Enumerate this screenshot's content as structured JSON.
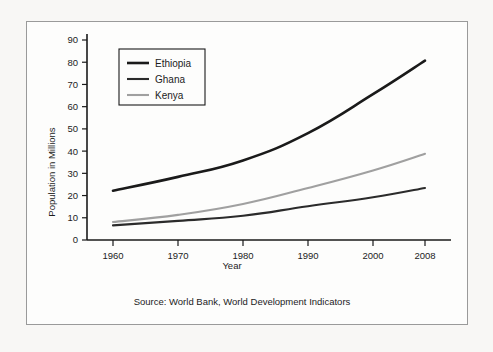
{
  "figure": {
    "source_note": "Source: World Bank, World Development Indicators",
    "frame_color": "#9a9a9a",
    "background_color": "#f8f7f5",
    "panel_color": "#fdfdfc"
  },
  "chart_data": {
    "type": "line",
    "title": "",
    "xlabel": "Year",
    "ylabel": "Population in Millions",
    "x": [
      1960,
      1970,
      1980,
      1990,
      2000,
      2008
    ],
    "categories": [
      "1960",
      "1970",
      "1980",
      "1990",
      "2000",
      "2008"
    ],
    "xlim": [
      1956,
      2012
    ],
    "ylim": [
      0,
      90
    ],
    "xticks": [
      1960,
      1970,
      1980,
      1990,
      2000,
      2008
    ],
    "xticklabels": [
      "1960",
      "1970",
      "1980",
      "1990",
      "2000",
      "2008"
    ],
    "yticks": [
      0,
      10,
      20,
      30,
      40,
      50,
      60,
      70,
      80,
      90
    ],
    "yticklabels": [
      "0",
      "10",
      "20",
      "30",
      "40",
      "50",
      "60",
      "70",
      "80",
      "90"
    ],
    "grid": false,
    "legend_position": "upper left",
    "series": [
      {
        "name": "Ethiopia",
        "values": [
          22.2,
          28.4,
          35.8,
          48.1,
          65.6,
          80.7
        ],
        "color": "#1a1a1a",
        "width": 2.6
      },
      {
        "name": "Ghana",
        "values": [
          6.6,
          8.6,
          10.9,
          15.2,
          19.2,
          23.4
        ],
        "color": "#2b2b2b",
        "width": 2.1
      },
      {
        "name": "Kenya",
        "values": [
          8.1,
          11.3,
          16.2,
          23.4,
          31.3,
          38.8
        ],
        "color": "#a0a0a0",
        "width": 2.1
      }
    ]
  },
  "legend": {
    "items": [
      {
        "label": "Ethiopia"
      },
      {
        "label": "Ghana"
      },
      {
        "label": "Kenya"
      }
    ]
  }
}
